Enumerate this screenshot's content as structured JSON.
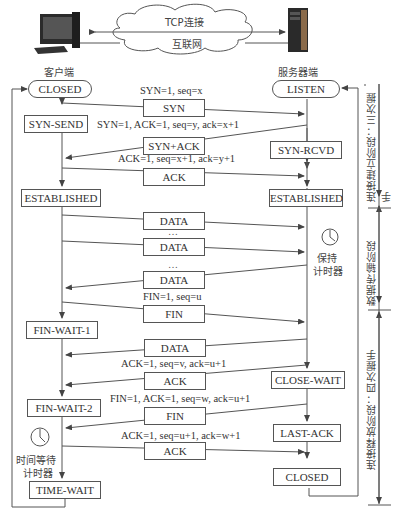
{
  "header": {
    "cloud_top": "TCP连接",
    "cloud_bottom": "互联网",
    "client_label": "客户端",
    "server_label": "服务器端"
  },
  "client_states": [
    "CLOSED",
    "SYN-SEND",
    "ESTABLISHED",
    "FIN-WAIT-1",
    "FIN-WAIT-2",
    "TIME-WAIT"
  ],
  "server_states": [
    "LISTEN",
    "SYN-RCVD",
    "ESTABLISHED",
    "CLOSE-WAIT",
    "LAST-ACK",
    "CLOSED"
  ],
  "messages": [
    {
      "box": "SYN",
      "label": "SYN=1, seq=x",
      "direction": "client-to-server"
    },
    {
      "box": "SYN+ACK",
      "label": "SYN=1, ACK=1, seq=y, ack=x+1",
      "direction": "server-to-client"
    },
    {
      "box": "ACK",
      "label": "ACK=1, seq=x+1, ack=y+1",
      "direction": "client-to-server"
    },
    {
      "box": "DATA",
      "label": "",
      "direction": "client-to-server"
    },
    {
      "box": "DATA",
      "label": "",
      "direction": "client-to-server"
    },
    {
      "box": "DATA",
      "label": "",
      "direction": "server-to-client"
    },
    {
      "box": "FIN",
      "label": "FIN=1, seq=u",
      "direction": "client-to-server"
    },
    {
      "box": "DATA",
      "label": "",
      "direction": "server-to-client"
    },
    {
      "box": "ACK",
      "label": "ACK=1, seq=v, ack=u+1",
      "direction": "server-to-client"
    },
    {
      "box": "FIN",
      "label": "FIN=1, ACK=1, seq=w, ack=u+1",
      "direction": "server-to-client"
    },
    {
      "box": "ACK",
      "label": "ACK=1, seq=u+1, ack=w+1",
      "direction": "client-to-server"
    }
  ],
  "ellipsis": "…",
  "timers": {
    "keepalive": [
      "保持",
      "计时器"
    ],
    "time_wait": [
      "时间等待",
      "计时器"
    ]
  },
  "phases": {
    "establish": "连接建立阶段：三次握手",
    "transfer": "数据传输阶段",
    "release": "连接释放阶段：四次握手"
  }
}
